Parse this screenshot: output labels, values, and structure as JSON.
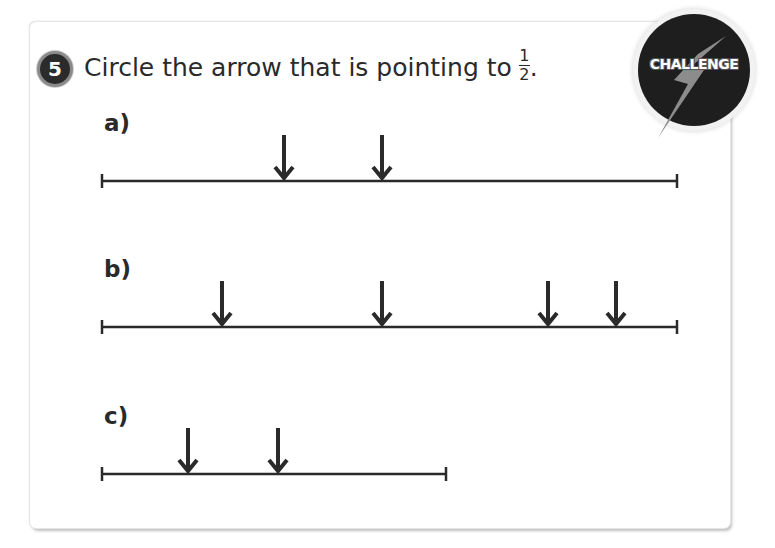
{
  "question": {
    "number": "5",
    "text": "Circle the arrow that is pointing to",
    "fraction": {
      "numerator": "1",
      "denominator": "2"
    },
    "end_punctuation": "."
  },
  "badge": {
    "label": "CHALLENGE",
    "icon": "lightning-bolt-icon"
  },
  "parts": [
    {
      "label": "a)",
      "line": {
        "x1": 102,
        "x2": 677,
        "y": 181
      },
      "arrows_x": [
        284,
        382
      ]
    },
    {
      "label": "b)",
      "line": {
        "x1": 102,
        "x2": 677,
        "y": 327
      },
      "arrows_x": [
        222,
        382,
        548,
        616
      ]
    },
    {
      "label": "c)",
      "line": {
        "x1": 102,
        "x2": 446,
        "y": 474
      },
      "arrows_x": [
        188,
        278
      ]
    }
  ],
  "colors": {
    "ink": "#2a2a2a",
    "badge_bg": "#1e1e1e",
    "bolt": "#8c8c8c"
  }
}
